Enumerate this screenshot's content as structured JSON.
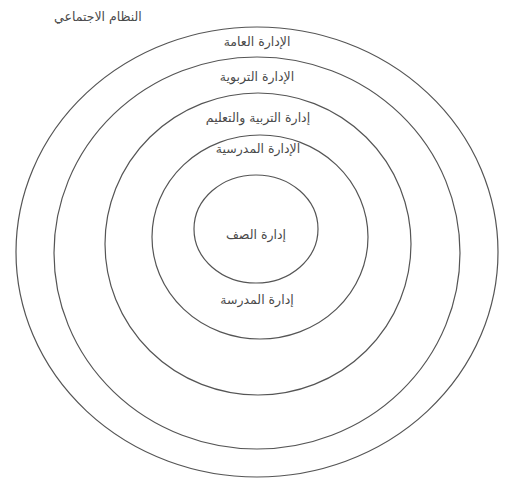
{
  "diagram": {
    "type": "concentric-circles",
    "outside_label": "النظام الاجتماعي",
    "rings": [
      {
        "id": "general-administration",
        "label": "الإدارة العامة"
      },
      {
        "id": "educational-administration",
        "label": "الإدارة التربوية"
      },
      {
        "id": "education-directorate",
        "label": "إدارة التربية والتعليم"
      },
      {
        "id": "school-administration",
        "label": "الإدارة المدرسية"
      },
      {
        "id": "classroom-management",
        "label": "إدارة الصف"
      }
    ],
    "extra_labels": {
      "school_management": "إدارة المدرسة"
    },
    "colors": {
      "stroke": "#555555",
      "text": "#4a4a4a",
      "background": "#ffffff"
    }
  }
}
